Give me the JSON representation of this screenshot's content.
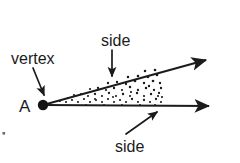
{
  "diagram": {
    "background_color": "#ffffff",
    "ink_color": "#1b1b1b",
    "labels": {
      "vertex": "vertex",
      "point": "A",
      "side_top": "side",
      "side_bottom": "side"
    },
    "geometry": {
      "vertex_point": {
        "label": "A",
        "x": 43,
        "y": 105
      },
      "rays": [
        {
          "name": "upper-ray",
          "from": {
            "x": 43,
            "y": 105
          },
          "to": {
            "x": 212,
            "y": 58
          },
          "arrowhead": "end"
        },
        {
          "name": "lower-ray",
          "from": {
            "x": 43,
            "y": 105
          },
          "to": {
            "x": 216,
            "y": 106
          },
          "arrowhead": "end"
        }
      ],
      "interior_fill": "stippled-dots",
      "stipple_extent_x": 163
    },
    "pointers": [
      {
        "name": "vertex-pointer",
        "from": {
          "x": 33,
          "y": 68
        },
        "to": {
          "x": 44,
          "y": 98
        },
        "label": "vertex"
      },
      {
        "name": "side-top-pointer",
        "from": {
          "x": 112,
          "y": 50
        },
        "to": {
          "x": 112,
          "y": 79
        },
        "label": "side"
      },
      {
        "name": "side-bottom-pointer",
        "from": {
          "x": 126,
          "y": 134
        },
        "to": {
          "x": 159,
          "y": 110
        },
        "label": "side"
      }
    ]
  }
}
